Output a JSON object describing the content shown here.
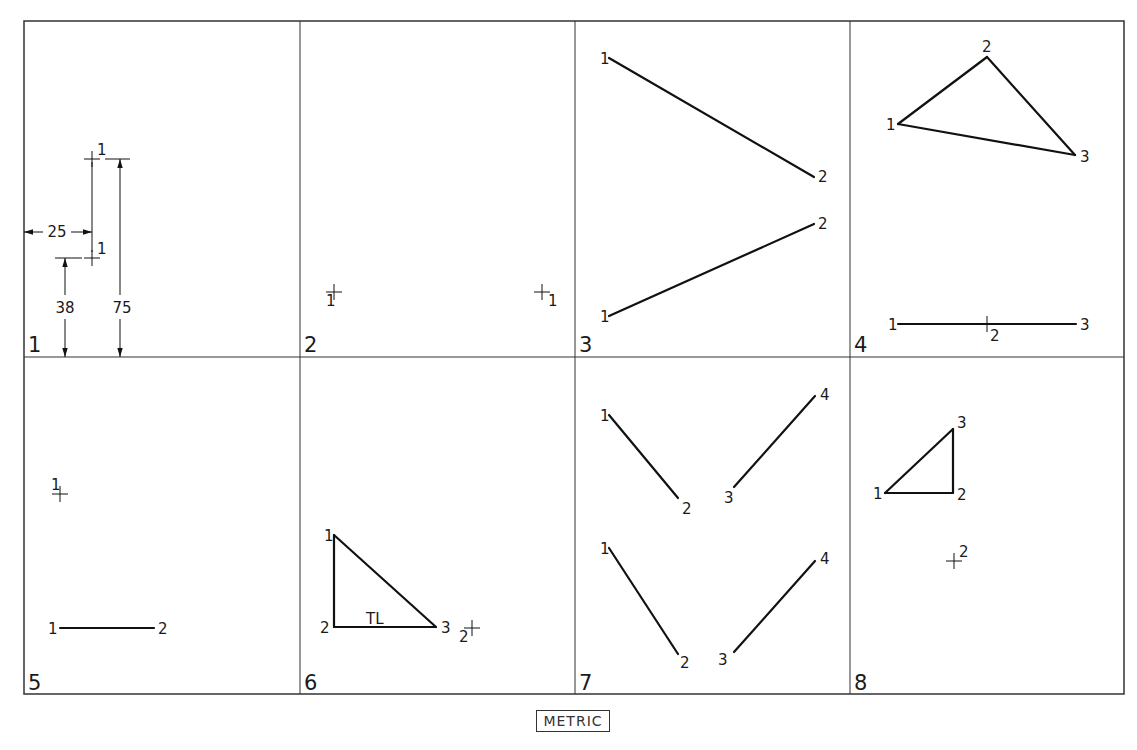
{
  "colors": {
    "line": "#111111",
    "border": "#333333",
    "background": "#ffffff"
  },
  "grid": {
    "xs": [
      24,
      300,
      575,
      850,
      1124
    ],
    "ys": [
      21,
      357,
      694
    ]
  },
  "footer": {
    "label": "METRIC"
  },
  "panels": [
    {
      "number": "1",
      "num_pos": [
        28,
        352
      ],
      "crosses": [
        {
          "x": 92,
          "y": 159,
          "label": "1",
          "lx": 97,
          "ly": 155
        },
        {
          "x": 92,
          "y": 258,
          "label": "1",
          "lx": 97,
          "ly": 254
        }
      ],
      "segments": [],
      "dimensions": [
        {
          "label": "25",
          "type": "horizontal",
          "x1": 24,
          "x2": 92,
          "y": 232,
          "text_x": 57,
          "text_y": 237
        },
        {
          "label": "38",
          "type": "vertical",
          "x": 65,
          "y1": 258,
          "y2": 357,
          "text_x": 65,
          "text_y": 313,
          "ext_x1": 55,
          "ext_x2": 82
        },
        {
          "label": "75",
          "type": "vertical",
          "x": 120,
          "y1": 159,
          "y2": 357,
          "text_x": 122,
          "text_y": 313,
          "ext_x1": 105,
          "ext_x2": 130
        }
      ],
      "labels": []
    },
    {
      "number": "2",
      "num_pos": [
        304,
        352
      ],
      "crosses": [
        {
          "x": 334,
          "y": 292,
          "label": "1",
          "lx": 326,
          "ly": 306
        },
        {
          "x": 542,
          "y": 292,
          "label": "1",
          "lx": 548,
          "ly": 306
        }
      ],
      "segments": [],
      "dimensions": [],
      "labels": []
    },
    {
      "number": "3",
      "num_pos": [
        579,
        352
      ],
      "crosses": [],
      "segments": [
        {
          "x1": 609,
          "y1": 58,
          "x2": 814,
          "y2": 177
        },
        {
          "x1": 609,
          "y1": 316,
          "x2": 814,
          "y2": 224
        }
      ],
      "dimensions": [],
      "labels": [
        {
          "t": "1",
          "x": 600,
          "y": 64
        },
        {
          "t": "2",
          "x": 818,
          "y": 182
        },
        {
          "t": "2",
          "x": 818,
          "y": 229
        },
        {
          "t": "1",
          "x": 600,
          "y": 322
        }
      ]
    },
    {
      "number": "4",
      "num_pos": [
        854,
        352
      ],
      "crosses": [
        {
          "x": 987,
          "y": 324,
          "label": "",
          "lx": 0,
          "ly": 0
        }
      ],
      "segments": [
        {
          "x1": 898,
          "y1": 124,
          "x2": 987,
          "y2": 57
        },
        {
          "x1": 987,
          "y1": 57,
          "x2": 1075,
          "y2": 155
        },
        {
          "x1": 1075,
          "y1": 155,
          "x2": 898,
          "y2": 124
        },
        {
          "x1": 898,
          "y1": 324,
          "x2": 1076,
          "y2": 324
        }
      ],
      "dimensions": [],
      "labels": [
        {
          "t": "2",
          "x": 982,
          "y": 52
        },
        {
          "t": "1",
          "x": 886,
          "y": 130
        },
        {
          "t": "3",
          "x": 1080,
          "y": 162
        },
        {
          "t": "1",
          "x": 888,
          "y": 330
        },
        {
          "t": "2",
          "x": 990,
          "y": 341
        },
        {
          "t": "3",
          "x": 1080,
          "y": 330
        }
      ]
    },
    {
      "number": "5",
      "num_pos": [
        28,
        690
      ],
      "crosses": [
        {
          "x": 60,
          "y": 494,
          "label": "1",
          "lx": 51,
          "ly": 490
        }
      ],
      "segments": [
        {
          "x1": 60,
          "y1": 628,
          "x2": 154,
          "y2": 628
        }
      ],
      "dimensions": [],
      "labels": [
        {
          "t": "1",
          "x": 48,
          "y": 634
        },
        {
          "t": "2",
          "x": 158,
          "y": 634
        }
      ]
    },
    {
      "number": "6",
      "num_pos": [
        304,
        690
      ],
      "crosses": [
        {
          "x": 472,
          "y": 628,
          "label": "2",
          "lx": 459,
          "ly": 642
        }
      ],
      "segments": [
        {
          "x1": 334,
          "y1": 535,
          "x2": 334,
          "y2": 627
        },
        {
          "x1": 334,
          "y1": 627,
          "x2": 436,
          "y2": 627
        },
        {
          "x1": 436,
          "y1": 627,
          "x2": 334,
          "y2": 535
        }
      ],
      "dimensions": [],
      "labels": [
        {
          "t": "1",
          "x": 324,
          "y": 541
        },
        {
          "t": "2",
          "x": 320,
          "y": 633
        },
        {
          "t": "3",
          "x": 441,
          "y": 633
        },
        {
          "t": "TL",
          "x": 366,
          "y": 624
        }
      ]
    },
    {
      "number": "7",
      "num_pos": [
        579,
        690
      ],
      "crosses": [],
      "segments": [
        {
          "x1": 609,
          "y1": 415,
          "x2": 678,
          "y2": 498
        },
        {
          "x1": 734,
          "y1": 487,
          "x2": 815,
          "y2": 396
        },
        {
          "x1": 609,
          "y1": 548,
          "x2": 678,
          "y2": 654
        },
        {
          "x1": 734,
          "y1": 652,
          "x2": 815,
          "y2": 561
        }
      ],
      "dimensions": [],
      "labels": [
        {
          "t": "1",
          "x": 600,
          "y": 421
        },
        {
          "t": "2",
          "x": 682,
          "y": 514
        },
        {
          "t": "3",
          "x": 724,
          "y": 503
        },
        {
          "t": "4",
          "x": 820,
          "y": 400
        },
        {
          "t": "1",
          "x": 600,
          "y": 554
        },
        {
          "t": "2",
          "x": 680,
          "y": 668
        },
        {
          "t": "3",
          "x": 718,
          "y": 665
        },
        {
          "t": "4",
          "x": 820,
          "y": 564
        }
      ]
    },
    {
      "number": "8",
      "num_pos": [
        854,
        690
      ],
      "crosses": [
        {
          "x": 954,
          "y": 561,
          "label": "2",
          "lx": 959,
          "ly": 557
        }
      ],
      "segments": [
        {
          "x1": 885,
          "y1": 493,
          "x2": 953,
          "y2": 493
        },
        {
          "x1": 953,
          "y1": 493,
          "x2": 953,
          "y2": 429
        },
        {
          "x1": 953,
          "y1": 429,
          "x2": 885,
          "y2": 493
        }
      ],
      "dimensions": [],
      "labels": [
        {
          "t": "1",
          "x": 873,
          "y": 499
        },
        {
          "t": "2",
          "x": 957,
          "y": 500
        },
        {
          "t": "3",
          "x": 957,
          "y": 428
        }
      ]
    }
  ]
}
